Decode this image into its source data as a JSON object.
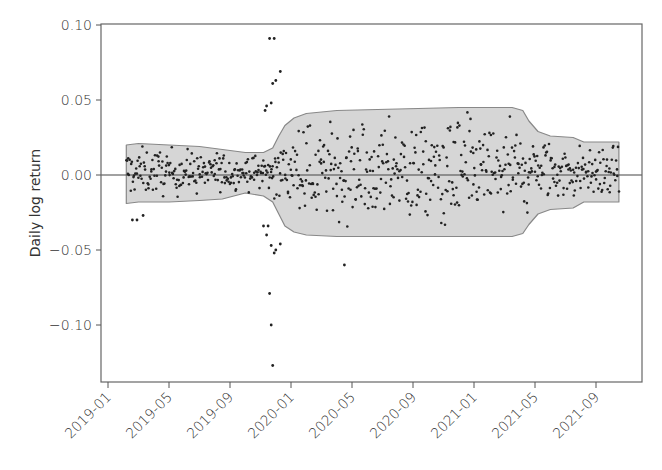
{
  "chart_data": {
    "type": "scatter",
    "title": "",
    "xlabel": "",
    "ylabel": "Daily log return",
    "ylim": [
      -0.135,
      0.1
    ],
    "xlim": [
      "2018-12-15",
      "2021-11-20"
    ],
    "grid": false,
    "legend": null,
    "y_ticks": [
      {
        "value": 0.1,
        "label": "0.10"
      },
      {
        "value": 0.05,
        "label": "0.05"
      },
      {
        "value": 0.0,
        "label": "0.00"
      },
      {
        "value": -0.05,
        "label": "−0.05"
      },
      {
        "value": -0.1,
        "label": "−0.10"
      }
    ],
    "x_ticks": [
      {
        "month_index": 0,
        "label": "2019-01"
      },
      {
        "month_index": 4,
        "label": "2019-05"
      },
      {
        "month_index": 8,
        "label": "2019-09"
      },
      {
        "month_index": 12,
        "label": "2020-01"
      },
      {
        "month_index": 16,
        "label": "2020-05"
      },
      {
        "month_index": 20,
        "label": "2020-09"
      },
      {
        "month_index": 24,
        "label": "2021-01"
      },
      {
        "month_index": 28,
        "label": "2021-05"
      },
      {
        "month_index": 32,
        "label": "2021-09"
      }
    ],
    "reference_line": {
      "y": 0.0,
      "color": "#444444"
    },
    "envelope": {
      "description": "Shaded volatility band (upper/lower bounds by month index)",
      "fill": "#d6d6d6",
      "stroke": "#888888",
      "points": [
        {
          "m": 1.2,
          "upper": 0.02,
          "lower": -0.019
        },
        {
          "m": 2.0,
          "upper": 0.021,
          "lower": -0.018
        },
        {
          "m": 4.0,
          "upper": 0.02,
          "lower": -0.018
        },
        {
          "m": 6.0,
          "upper": 0.019,
          "lower": -0.017
        },
        {
          "m": 7.5,
          "upper": 0.017,
          "lower": -0.016
        },
        {
          "m": 9.0,
          "upper": 0.015,
          "lower": -0.012
        },
        {
          "m": 10.2,
          "upper": 0.015,
          "lower": -0.014
        },
        {
          "m": 10.8,
          "upper": 0.018,
          "lower": -0.018
        },
        {
          "m": 11.2,
          "upper": 0.026,
          "lower": -0.026
        },
        {
          "m": 11.6,
          "upper": 0.033,
          "lower": -0.034
        },
        {
          "m": 12.2,
          "upper": 0.038,
          "lower": -0.038
        },
        {
          "m": 13.0,
          "upper": 0.041,
          "lower": -0.04
        },
        {
          "m": 15.0,
          "upper": 0.043,
          "lower": -0.041
        },
        {
          "m": 19.0,
          "upper": 0.044,
          "lower": -0.041
        },
        {
          "m": 23.0,
          "upper": 0.045,
          "lower": -0.041
        },
        {
          "m": 26.5,
          "upper": 0.045,
          "lower": -0.041
        },
        {
          "m": 27.2,
          "upper": 0.043,
          "lower": -0.039
        },
        {
          "m": 27.6,
          "upper": 0.036,
          "lower": -0.033
        },
        {
          "m": 28.2,
          "upper": 0.029,
          "lower": -0.026
        },
        {
          "m": 29.0,
          "upper": 0.026,
          "lower": -0.023
        },
        {
          "m": 30.5,
          "upper": 0.025,
          "lower": -0.022
        },
        {
          "m": 31.2,
          "upper": 0.022,
          "lower": -0.018
        },
        {
          "m": 33.5,
          "upper": 0.022,
          "lower": -0.018
        }
      ]
    },
    "outliers": [
      {
        "m": 10.6,
        "y": 0.091
      },
      {
        "m": 10.9,
        "y": 0.091
      },
      {
        "m": 11.3,
        "y": 0.069
      },
      {
        "m": 11.0,
        "y": 0.063
      },
      {
        "m": 10.8,
        "y": 0.061
      },
      {
        "m": 10.7,
        "y": 0.048
      },
      {
        "m": 10.4,
        "y": 0.046
      },
      {
        "m": 10.3,
        "y": 0.043
      },
      {
        "m": 10.2,
        "y": -0.034
      },
      {
        "m": 10.5,
        "y": -0.034
      },
      {
        "m": 10.4,
        "y": -0.04
      },
      {
        "m": 10.7,
        "y": -0.047
      },
      {
        "m": 10.9,
        "y": -0.052
      },
      {
        "m": 11.0,
        "y": -0.05
      },
      {
        "m": 11.3,
        "y": -0.046
      },
      {
        "m": 10.6,
        "y": -0.079
      },
      {
        "m": 10.7,
        "y": -0.1
      },
      {
        "m": 10.8,
        "y": -0.127
      },
      {
        "m": 1.6,
        "y": -0.03
      },
      {
        "m": 1.9,
        "y": -0.03
      },
      {
        "m": 2.3,
        "y": -0.027
      },
      {
        "m": 15.5,
        "y": -0.06
      }
    ],
    "n_points_approx": 700,
    "x_range_months": [
      1.2,
      33.5
    ],
    "series_summary": "Dense cloud of daily returns mostly within the shaded band, clustered around 0.00; calmer early 2019 (|r|<~0.02), spike of extreme returns around Dec 2019 (up to ~+0.09 and ~-0.127), wider band through 2020 (~±0.04), narrower again from mid 2021 (~±0.02)."
  },
  "colors": {
    "background": "#ffffff",
    "axis": "#555555",
    "band_fill": "#d6d6d6",
    "band_stroke": "#888888",
    "point": "#222222",
    "zero_line": "#444444",
    "text": "#333333"
  }
}
